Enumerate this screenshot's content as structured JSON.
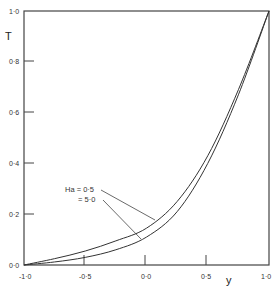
{
  "chart_data": {
    "type": "line",
    "title": "",
    "xlabel": "y",
    "ylabel": "T",
    "xlim": [
      -1.0,
      1.0
    ],
    "ylim": [
      0.0,
      1.0
    ],
    "grid": false,
    "legend_position": "annotation (center-left, with leader lines)",
    "x_ticks": [
      "-1·0",
      "-0·5",
      "0·0",
      "0·5",
      "1·0"
    ],
    "x_tick_values": [
      -1.0,
      -0.5,
      0.0,
      0.5,
      1.0
    ],
    "y_ticks": [
      "0·0",
      "0·2",
      "0·4",
      "0·6",
      "0·8",
      "1·0"
    ],
    "y_tick_values": [
      0.0,
      0.2,
      0.4,
      0.6,
      0.8,
      1.0
    ],
    "annotations": [
      {
        "text": "Ha = 0·5",
        "points_to_series": "Ha = 0.5"
      },
      {
        "text": "= 5·0",
        "points_to_series": "Ha = 5.0"
      }
    ],
    "x": [
      -1.0,
      -0.75,
      -0.5,
      -0.25,
      0.0,
      0.25,
      0.5,
      0.75,
      1.0
    ],
    "series": [
      {
        "name": "Ha = 0.5",
        "values": [
          0.0,
          0.025,
          0.055,
          0.095,
          0.145,
          0.25,
          0.43,
          0.69,
          1.0
        ]
      },
      {
        "name": "Ha = 5.0",
        "values": [
          0.0,
          0.012,
          0.03,
          0.06,
          0.11,
          0.21,
          0.4,
          0.67,
          1.0
        ]
      }
    ]
  },
  "labels": {
    "xlabel": "y",
    "ylabel": "T",
    "anno1": "Ha = 0·5",
    "anno2": "= 5·0",
    "xt0": "-1·0",
    "xt1": "-0·5",
    "xt2": "0·0",
    "xt3": "0·5",
    "xt4": "1·0",
    "yt0": "0·0",
    "yt1": "0·2",
    "yt2": "0·4",
    "yt3": "0·6",
    "yt4": "0·8",
    "yt5": "1·0"
  }
}
